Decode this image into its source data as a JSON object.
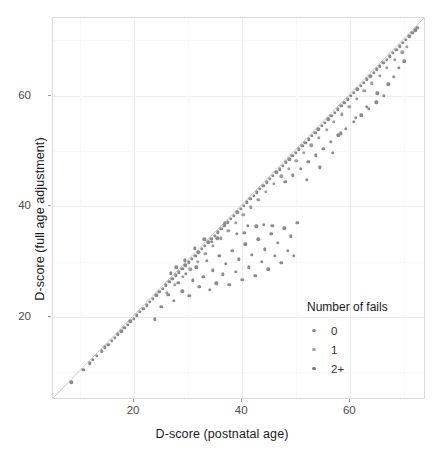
{
  "chart_data": {
    "type": "scatter",
    "title": "",
    "xlabel": "D-score (postnatal age)",
    "ylabel": "D-score (full age adjustment)",
    "xlim": [
      5,
      74
    ],
    "ylim": [
      5,
      74
    ],
    "xticks": [
      20,
      40,
      60
    ],
    "yticks": [
      20,
      40,
      60
    ],
    "xtick_labels": [
      "20",
      "40",
      "60"
    ],
    "ytick_labels": [
      "20",
      "40",
      "60"
    ],
    "grid": true,
    "legend_position": "inside-bottom-right",
    "reference_line": {
      "type": "identity",
      "slope": 1,
      "intercept": 0,
      "color": "#c8c8c8"
    },
    "point_color": "#8c8c8c",
    "point_size": 3.4,
    "series": [
      {
        "name": "0",
        "color": "#8c8c8c",
        "points": [
          [
            8.4,
            8.2
          ],
          [
            10.6,
            10.4
          ],
          [
            11.8,
            11.6
          ],
          [
            12.4,
            12.3
          ],
          [
            13.1,
            13.0
          ],
          [
            14.0,
            13.8
          ],
          [
            14.6,
            14.5
          ],
          [
            15.2,
            15.0
          ],
          [
            15.9,
            15.7
          ],
          [
            16.4,
            16.2
          ],
          [
            17.0,
            16.9
          ],
          [
            17.6,
            17.4
          ],
          [
            18.2,
            18.0
          ],
          [
            18.8,
            18.6
          ],
          [
            19.3,
            19.2
          ],
          [
            19.9,
            19.7
          ],
          [
            20.5,
            20.3
          ],
          [
            21.1,
            20.9
          ],
          [
            21.7,
            21.5
          ],
          [
            22.3,
            22.1
          ],
          [
            22.9,
            22.7
          ],
          [
            23.5,
            23.3
          ],
          [
            24.1,
            23.9
          ],
          [
            24.7,
            24.5
          ],
          [
            25.3,
            25.1
          ],
          [
            25.9,
            25.7
          ],
          [
            26.5,
            26.3
          ],
          [
            27.1,
            26.9
          ],
          [
            27.7,
            27.5
          ],
          [
            28.3,
            28.1
          ],
          [
            28.9,
            28.7
          ],
          [
            29.5,
            29.3
          ],
          [
            30.1,
            29.9
          ],
          [
            30.7,
            30.5
          ],
          [
            31.3,
            31.1
          ],
          [
            31.9,
            31.7
          ],
          [
            32.5,
            32.3
          ],
          [
            33.1,
            32.9
          ],
          [
            33.7,
            33.5
          ],
          [
            34.3,
            34.1
          ],
          [
            34.9,
            34.7
          ],
          [
            35.5,
            35.3
          ],
          [
            36.1,
            35.9
          ],
          [
            36.7,
            36.5
          ],
          [
            37.3,
            37.1
          ],
          [
            37.9,
            37.7
          ],
          [
            38.5,
            38.3
          ],
          [
            39.1,
            38.9
          ],
          [
            39.7,
            39.5
          ],
          [
            40.3,
            40.1
          ],
          [
            40.9,
            40.7
          ],
          [
            41.5,
            41.3
          ],
          [
            42.1,
            41.9
          ],
          [
            42.7,
            42.5
          ],
          [
            43.3,
            43.1
          ],
          [
            43.9,
            43.7
          ],
          [
            44.5,
            44.3
          ],
          [
            45.1,
            44.9
          ],
          [
            45.7,
            45.5
          ],
          [
            46.3,
            46.1
          ],
          [
            46.9,
            46.7
          ],
          [
            47.5,
            47.3
          ],
          [
            48.1,
            47.9
          ],
          [
            48.7,
            48.5
          ],
          [
            49.3,
            49.1
          ],
          [
            49.9,
            49.7
          ],
          [
            50.5,
            50.3
          ],
          [
            51.1,
            50.9
          ],
          [
            51.7,
            51.5
          ],
          [
            52.3,
            52.1
          ],
          [
            52.9,
            52.7
          ],
          [
            53.5,
            53.3
          ],
          [
            54.1,
            53.9
          ],
          [
            54.7,
            54.5
          ],
          [
            55.3,
            55.1
          ],
          [
            55.9,
            55.7
          ],
          [
            56.5,
            56.3
          ],
          [
            57.1,
            56.9
          ],
          [
            57.7,
            57.5
          ],
          [
            58.3,
            58.1
          ],
          [
            58.9,
            58.7
          ],
          [
            59.5,
            59.3
          ],
          [
            60.1,
            59.9
          ],
          [
            60.7,
            60.5
          ],
          [
            61.3,
            61.1
          ],
          [
            61.9,
            61.7
          ],
          [
            62.5,
            62.3
          ],
          [
            63.1,
            62.9
          ],
          [
            63.7,
            63.5
          ],
          [
            64.3,
            64.1
          ],
          [
            64.9,
            64.7
          ],
          [
            65.5,
            65.3
          ],
          [
            66.1,
            65.9
          ],
          [
            66.7,
            66.5
          ],
          [
            67.3,
            67.1
          ],
          [
            67.9,
            67.7
          ],
          [
            68.5,
            68.3
          ],
          [
            69.1,
            68.9
          ],
          [
            69.7,
            69.5
          ],
          [
            70.3,
            70.1
          ],
          [
            70.9,
            70.7
          ],
          [
            71.5,
            71.3
          ],
          [
            72.0,
            71.8
          ],
          [
            72.4,
            72.2
          ]
        ]
      },
      {
        "name": "1",
        "color": "#9d9d9d",
        "points": [
          [
            26.0,
            24.4
          ],
          [
            27.5,
            25.8
          ],
          [
            29.0,
            27.3
          ],
          [
            30.4,
            28.6
          ],
          [
            31.8,
            30.0
          ],
          [
            33.2,
            31.4
          ],
          [
            34.6,
            32.8
          ],
          [
            36.0,
            34.2
          ],
          [
            37.4,
            35.6
          ],
          [
            38.8,
            37.0
          ],
          [
            40.2,
            38.4
          ],
          [
            41.6,
            39.8
          ],
          [
            43.0,
            41.2
          ],
          [
            44.4,
            42.6
          ],
          [
            45.8,
            44.0
          ],
          [
            47.2,
            45.4
          ],
          [
            48.6,
            46.8
          ],
          [
            50.0,
            48.2
          ],
          [
            51.4,
            49.6
          ],
          [
            52.8,
            51.0
          ],
          [
            54.2,
            52.4
          ],
          [
            55.6,
            53.8
          ],
          [
            57.0,
            55.2
          ],
          [
            58.4,
            56.6
          ],
          [
            59.8,
            58.0
          ],
          [
            61.2,
            59.4
          ],
          [
            62.6,
            60.8
          ],
          [
            64.0,
            62.2
          ],
          [
            65.4,
            63.6
          ],
          [
            66.8,
            65.0
          ],
          [
            68.2,
            66.4
          ],
          [
            69.6,
            67.8
          ],
          [
            70.5,
            68.8
          ]
        ]
      },
      {
        "name": "2+",
        "color": "#8c8c8c",
        "points": [
          [
            23.8,
            19.6
          ],
          [
            25.0,
            21.8
          ],
          [
            26.3,
            24.0
          ],
          [
            27.4,
            22.9
          ],
          [
            28.2,
            26.2
          ],
          [
            28.9,
            24.6
          ],
          [
            29.6,
            27.8
          ],
          [
            30.2,
            23.8
          ],
          [
            30.9,
            26.6
          ],
          [
            31.5,
            29.0
          ],
          [
            32.1,
            25.4
          ],
          [
            32.8,
            27.2
          ],
          [
            33.4,
            30.1
          ],
          [
            34.0,
            24.9
          ],
          [
            34.6,
            28.4
          ],
          [
            35.2,
            26.1
          ],
          [
            35.8,
            31.0
          ],
          [
            36.4,
            27.7
          ],
          [
            37.0,
            29.6
          ],
          [
            37.6,
            25.8
          ],
          [
            38.2,
            32.0
          ],
          [
            38.8,
            28.2
          ],
          [
            39.4,
            30.4
          ],
          [
            40.0,
            26.7
          ],
          [
            40.6,
            33.1
          ],
          [
            41.2,
            29.0
          ],
          [
            41.8,
            31.2
          ],
          [
            42.4,
            27.4
          ],
          [
            43.0,
            34.0
          ],
          [
            43.6,
            30.0
          ],
          [
            44.2,
            32.2
          ],
          [
            44.8,
            28.6
          ],
          [
            45.4,
            35.0
          ],
          [
            46.0,
            31.0
          ],
          [
            46.6,
            33.4
          ],
          [
            47.2,
            29.8
          ],
          [
            47.8,
            36.0
          ],
          [
            48.4,
            32.0
          ],
          [
            49.0,
            34.6
          ],
          [
            49.6,
            31.0
          ],
          [
            50.2,
            37.0
          ],
          [
            41.0,
            36.5
          ],
          [
            42.6,
            36.4
          ],
          [
            44.0,
            36.6
          ],
          [
            45.6,
            36.5
          ],
          [
            36.8,
            36.9
          ],
          [
            33.0,
            34.0
          ],
          [
            34.4,
            33.6
          ],
          [
            35.4,
            34.2
          ],
          [
            31.2,
            32.4
          ],
          [
            29.4,
            30.2
          ],
          [
            27.8,
            29.0
          ],
          [
            26.8,
            27.9
          ],
          [
            39.0,
            35.0
          ],
          [
            40.4,
            35.2
          ],
          [
            48.0,
            44.4
          ],
          [
            49.4,
            45.6
          ],
          [
            50.8,
            46.8
          ],
          [
            52.2,
            48.0
          ],
          [
            53.6,
            49.2
          ],
          [
            55.0,
            50.4
          ],
          [
            56.4,
            51.6
          ],
          [
            57.8,
            52.8
          ],
          [
            59.2,
            54.0
          ],
          [
            60.6,
            55.2
          ],
          [
            62.0,
            56.4
          ],
          [
            63.4,
            57.6
          ],
          [
            64.8,
            58.8
          ],
          [
            66.2,
            60.0
          ],
          [
            52.0,
            44.8
          ],
          [
            54.4,
            47.0
          ],
          [
            56.8,
            49.6
          ],
          [
            58.2,
            53.2
          ],
          [
            61.0,
            56.0
          ],
          [
            63.0,
            58.0
          ],
          [
            65.0,
            60.4
          ],
          [
            67.0,
            62.0
          ],
          [
            68.0,
            63.4
          ],
          [
            69.0,
            65.0
          ],
          [
            70.0,
            66.2
          ]
        ]
      }
    ]
  },
  "axes": {
    "x": {
      "title": "D-score (postnatal age)",
      "ticks": [
        {
          "value": 20,
          "label": "20"
        },
        {
          "value": 40,
          "label": "40"
        },
        {
          "value": 60,
          "label": "60"
        }
      ]
    },
    "y": {
      "title": "D-score (full age adjustment)",
      "ticks": [
        {
          "value": 20,
          "label": "20"
        },
        {
          "value": 40,
          "label": "40"
        },
        {
          "value": 60,
          "label": "60"
        }
      ]
    }
  },
  "legend": {
    "title": "Number of fails",
    "items": [
      {
        "label": "0",
        "color": "#8f8f8f"
      },
      {
        "label": "1",
        "color": "#a8a8a8"
      },
      {
        "label": "2+",
        "color": "#7e7e7e"
      }
    ]
  }
}
